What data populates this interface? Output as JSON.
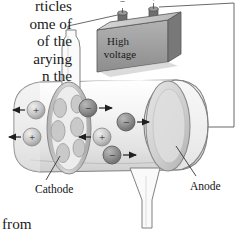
{
  "page": {
    "width": 237,
    "height": 234,
    "background": "#ffffff",
    "figure_subject": "cathode-ray / canal-ray discharge tube"
  },
  "book_text": {
    "top_lines": [
      "rticles",
      "ome of",
      " of the",
      "arying",
      "n the"
    ],
    "bottom_line": "t from"
  },
  "power_supply": {
    "label_line1": "High",
    "label_line2": "voltage",
    "terminal_left_sign": "−",
    "terminal_right_sign": "+",
    "box_face_color": "#9a9a9a",
    "box_top_color": "#c9c9c9",
    "box_side_color": "#6f6f6f"
  },
  "labels": {
    "cathode": "Cathode",
    "anode": "Anode"
  },
  "tube": {
    "glass_fill": "#f2f2f2",
    "glass_stroke": "#808080",
    "cathode_disk_color": "#c6c6c6",
    "anode_disk_color": "#d2d2d2"
  },
  "particles": [
    {
      "id": "p1",
      "sign": "+",
      "cx": 36,
      "cy": 110,
      "r": 9,
      "color": "#c4c4c4",
      "arrow": "left"
    },
    {
      "id": "p2",
      "sign": "+",
      "cx": 32,
      "cy": 137,
      "r": 9,
      "color": "#c4c4c4",
      "arrow": "left"
    },
    {
      "id": "p3",
      "sign": "−",
      "cx": 88,
      "cy": 108,
      "r": 9,
      "color": "#8e8e8e",
      "arrow": "right"
    },
    {
      "id": "p4",
      "sign": "+",
      "cx": 102,
      "cy": 137,
      "r": 9,
      "color": "#c4c4c4",
      "arrow": "left"
    },
    {
      "id": "p5",
      "sign": "−",
      "cx": 126,
      "cy": 122,
      "r": 9,
      "color": "#8e8e8e",
      "arrow": "right"
    },
    {
      "id": "p6",
      "sign": "−",
      "cx": 112,
      "cy": 155,
      "r": 9,
      "color": "#8e8e8e",
      "arrow": "right"
    }
  ],
  "cathode_holes": [
    {
      "cx": 60,
      "cy": 108,
      "rx": 7,
      "ry": 10
    },
    {
      "cx": 76,
      "cy": 104,
      "rx": 7,
      "ry": 10
    },
    {
      "cx": 58,
      "cy": 130,
      "rx": 8,
      "ry": 11
    },
    {
      "cx": 76,
      "cy": 126,
      "rx": 7,
      "ry": 10
    },
    {
      "cx": 63,
      "cy": 152,
      "rx": 7,
      "ry": 10
    },
    {
      "cx": 79,
      "cy": 147,
      "rx": 7,
      "ry": 10
    }
  ]
}
